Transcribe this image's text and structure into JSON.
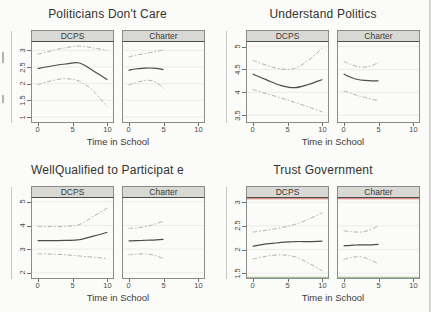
{
  "figure": {
    "panel_headers": [
      "DCPS",
      "Charter"
    ],
    "colors": {
      "mean_line": "#4d4d4b",
      "ci_line": "#b2b1ad",
      "gridline": "#ebebe7",
      "tick": "#6f6f6c",
      "panel_border": "#8b8b88",
      "header_bg": "#d8d8d4",
      "artifact_red": "#cf6a60",
      "artifact_green": "#a6c496"
    }
  },
  "chart_data": [
    {
      "type": "line",
      "title": "Politicians Don't Care",
      "xlabel": "Time in School",
      "xlim": [
        -0.8,
        10.8
      ],
      "xticks": [
        0,
        5,
        10
      ],
      "ylim": [
        0.85,
        3.25
      ],
      "yticks": [
        1,
        1.5,
        2,
        2.5,
        3
      ],
      "legend_position": "none",
      "subpanels": [
        {
          "label": "DCPS",
          "series": [
            {
              "name": "ci-upper",
              "style": "dashed",
              "x": [
                0,
                2,
                4,
                6,
                8,
                10
              ],
              "y": [
                2.88,
                2.99,
                3.08,
                3.13,
                3.07,
                3.0
              ]
            },
            {
              "name": "mean",
              "style": "solid",
              "x": [
                0,
                2,
                4,
                6,
                8,
                10
              ],
              "y": [
                2.45,
                2.53,
                2.59,
                2.62,
                2.38,
                2.12
              ]
            },
            {
              "name": "ci-lower",
              "style": "dashed",
              "x": [
                0,
                2,
                4,
                6,
                8,
                10
              ],
              "y": [
                1.97,
                2.09,
                2.15,
                2.07,
                1.78,
                1.3
              ]
            }
          ]
        },
        {
          "label": "Charter",
          "series": [
            {
              "name": "ci-upper",
              "style": "dashed",
              "x": [
                0,
                1,
                2,
                3,
                4,
                5
              ],
              "y": [
                2.8,
                2.85,
                2.89,
                2.93,
                2.97,
                3.01
              ]
            },
            {
              "name": "mean",
              "style": "solid",
              "x": [
                0,
                1,
                2,
                3,
                4,
                5
              ],
              "y": [
                2.4,
                2.44,
                2.46,
                2.47,
                2.46,
                2.42
              ]
            },
            {
              "name": "ci-lower",
              "style": "dashed",
              "x": [
                0,
                1,
                2,
                3,
                4,
                5
              ],
              "y": [
                1.96,
                2.03,
                2.08,
                2.1,
                2.03,
                1.86
              ]
            }
          ]
        }
      ]
    },
    {
      "type": "line",
      "title": "Understand Politics",
      "xlabel": "Time in School",
      "xlim": [
        -0.8,
        10.8
      ],
      "xticks": [
        0,
        5,
        10
      ],
      "ylim": [
        3.35,
        5.1
      ],
      "yticks": [
        3.5,
        4,
        4.5,
        5
      ],
      "legend_position": "none",
      "subpanels": [
        {
          "label": "DCPS",
          "series": [
            {
              "name": "ci-upper",
              "style": "dashed",
              "x": [
                0,
                2,
                4,
                6,
                8,
                10
              ],
              "y": [
                4.7,
                4.59,
                4.51,
                4.52,
                4.7,
                4.97
              ]
            },
            {
              "name": "mean",
              "style": "solid",
              "x": [
                0,
                2,
                4,
                6,
                8,
                10
              ],
              "y": [
                4.4,
                4.27,
                4.15,
                4.1,
                4.17,
                4.28
              ]
            },
            {
              "name": "ci-lower",
              "style": "dashed",
              "x": [
                0,
                2,
                4,
                6,
                8,
                10
              ],
              "y": [
                4.06,
                3.97,
                3.88,
                3.78,
                3.68,
                3.57
              ]
            }
          ]
        },
        {
          "label": "Charter",
          "series": [
            {
              "name": "ci-upper",
              "style": "dashed",
              "x": [
                0,
                1,
                2,
                3,
                4,
                5
              ],
              "y": [
                4.68,
                4.61,
                4.56,
                4.55,
                4.58,
                4.65
              ]
            },
            {
              "name": "mean",
              "style": "solid",
              "x": [
                0,
                1,
                2,
                3,
                4,
                5
              ],
              "y": [
                4.4,
                4.33,
                4.28,
                4.26,
                4.25,
                4.25
              ]
            },
            {
              "name": "ci-lower",
              "style": "dashed",
              "x": [
                0,
                1,
                2,
                3,
                4,
                5
              ],
              "y": [
                4.03,
                3.98,
                3.93,
                3.89,
                3.85,
                3.82
              ]
            }
          ]
        }
      ]
    },
    {
      "type": "line",
      "title": "WellQualified to Participat e",
      "xlabel": "Time in School",
      "xlim": [
        -0.8,
        10.8
      ],
      "xticks": [
        0,
        5,
        10
      ],
      "ylim": [
        1.78,
        5.16
      ],
      "yticks": [
        2,
        3,
        4,
        5
      ],
      "legend_position": "none",
      "subpanels": [
        {
          "label": "DCPS",
          "series": [
            {
              "name": "ci-upper",
              "style": "dashed",
              "x": [
                0,
                2,
                4,
                6,
                8,
                10
              ],
              "y": [
                3.95,
                3.95,
                3.96,
                4.04,
                4.38,
                4.74
              ]
            },
            {
              "name": "mean",
              "style": "solid",
              "x": [
                0,
                2,
                4,
                6,
                8,
                10
              ],
              "y": [
                3.36,
                3.36,
                3.37,
                3.4,
                3.55,
                3.71
              ]
            },
            {
              "name": "ci-lower",
              "style": "dashed",
              "x": [
                0,
                2,
                4,
                6,
                8,
                10
              ],
              "y": [
                2.8,
                2.79,
                2.76,
                2.71,
                2.66,
                2.6
              ]
            }
          ]
        },
        {
          "label": "Charter",
          "series": [
            {
              "name": "ci-upper",
              "style": "dashed",
              "x": [
                0,
                1,
                2,
                3,
                4,
                5
              ],
              "y": [
                3.88,
                3.89,
                3.93,
                3.99,
                4.08,
                4.18
              ]
            },
            {
              "name": "mean",
              "style": "solid",
              "x": [
                0,
                1,
                2,
                3,
                4,
                5
              ],
              "y": [
                3.35,
                3.36,
                3.37,
                3.38,
                3.39,
                3.41
              ]
            },
            {
              "name": "ci-lower",
              "style": "dashed",
              "x": [
                0,
                1,
                2,
                3,
                4,
                5
              ],
              "y": [
                2.76,
                2.79,
                2.8,
                2.78,
                2.71,
                2.6
              ]
            }
          ]
        }
      ]
    },
    {
      "type": "line",
      "title": "Trust Government",
      "xlabel": "Time in School",
      "xlim": [
        -0.8,
        10.8
      ],
      "xticks": [
        0,
        5,
        10
      ],
      "ylim": [
        1.4,
        3.09
      ],
      "yticks": [
        1.5,
        2,
        2.5,
        3
      ],
      "legend_position": "none",
      "artifacts": {
        "top": "#cf6a60",
        "bottom": "#a6c496"
      },
      "subpanels": [
        {
          "label": "DCPS",
          "series": [
            {
              "name": "ci-upper",
              "style": "dashed",
              "x": [
                0,
                2,
                4,
                6,
                8,
                10
              ],
              "y": [
                2.37,
                2.41,
                2.46,
                2.53,
                2.64,
                2.78
              ]
            },
            {
              "name": "mean",
              "style": "solid",
              "x": [
                0,
                2,
                4,
                6,
                8,
                10
              ],
              "y": [
                2.07,
                2.12,
                2.15,
                2.17,
                2.17,
                2.18
              ]
            },
            {
              "name": "ci-lower",
              "style": "dashed",
              "x": [
                0,
                2,
                4,
                6,
                8,
                10
              ],
              "y": [
                1.8,
                1.86,
                1.89,
                1.85,
                1.72,
                1.55
              ]
            }
          ]
        },
        {
          "label": "Charter",
          "series": [
            {
              "name": "ci-upper",
              "style": "dashed",
              "x": [
                0,
                1,
                2,
                3,
                4,
                5
              ],
              "y": [
                2.4,
                2.38,
                2.37,
                2.38,
                2.43,
                2.5
              ]
            },
            {
              "name": "mean",
              "style": "solid",
              "x": [
                0,
                1,
                2,
                3,
                4,
                5
              ],
              "y": [
                2.08,
                2.09,
                2.1,
                2.1,
                2.1,
                2.11
              ]
            },
            {
              "name": "ci-lower",
              "style": "dashed",
              "x": [
                0,
                1,
                2,
                3,
                4,
                5
              ],
              "y": [
                1.79,
                1.83,
                1.85,
                1.83,
                1.77,
                1.7
              ]
            }
          ]
        }
      ]
    }
  ]
}
